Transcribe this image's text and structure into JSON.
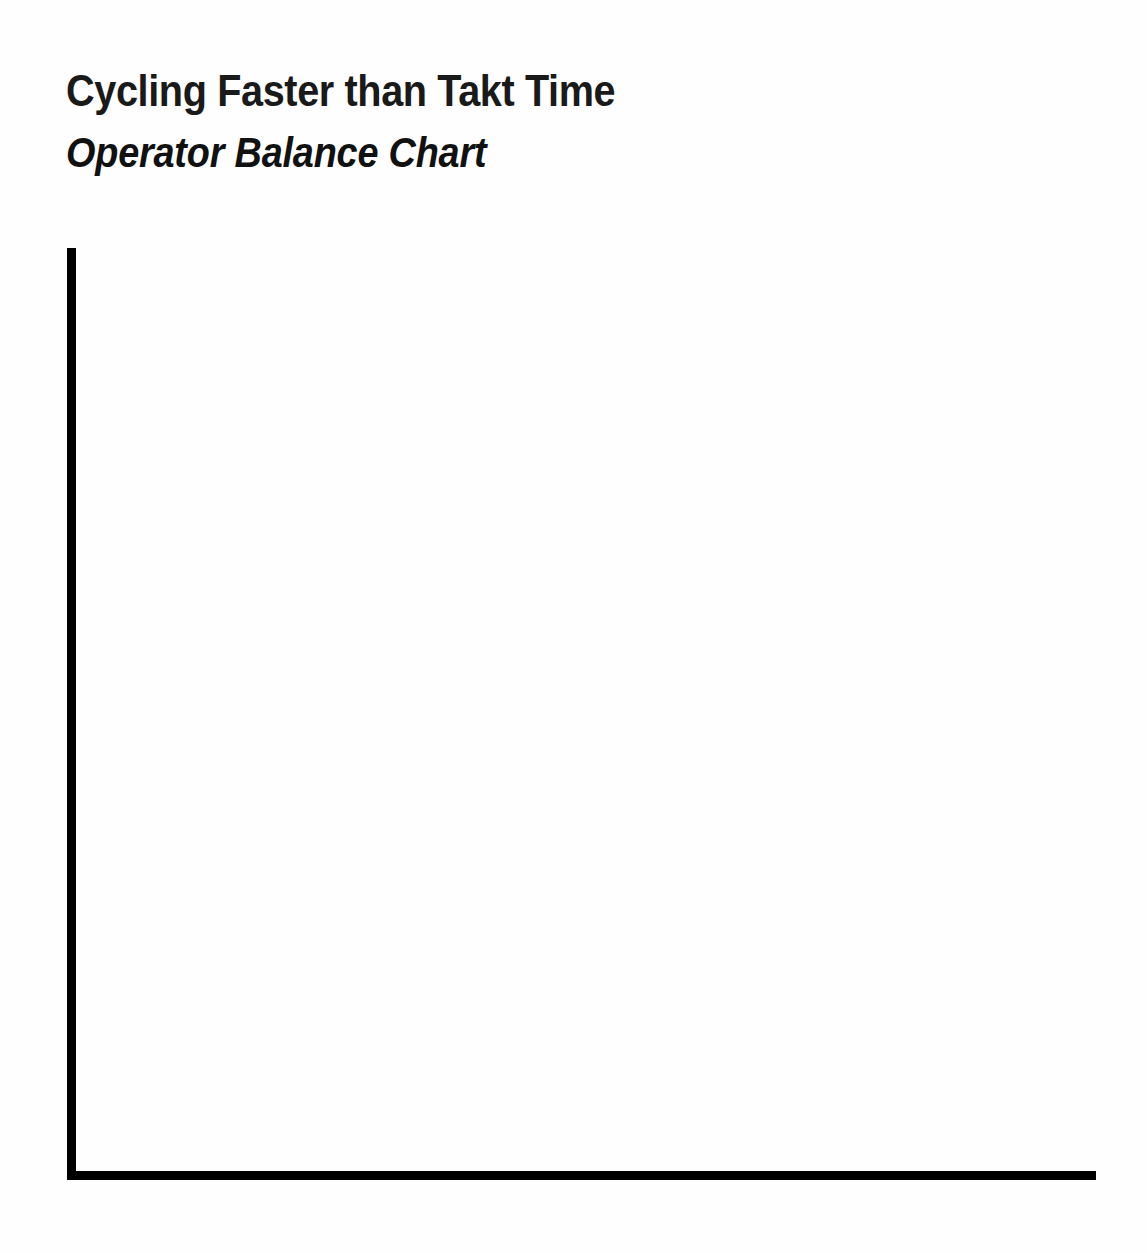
{
  "page": {
    "background_color": "#fefefe",
    "width": 1147,
    "height": 1253
  },
  "header": {
    "title": "Cycling Faster than Takt Time",
    "subtitle": "Operator Balance Chart"
  },
  "chart_data": {
    "type": "bar",
    "title": "Cycling Faster than Takt Time",
    "subtitle": "Operator Balance Chart",
    "categories": [],
    "values": [],
    "series": [],
    "xlabel": "",
    "ylabel": "",
    "xlim": null,
    "ylim": null,
    "grid": false,
    "legend": false,
    "legend_position": "none",
    "annotations": [],
    "axis_color": "#000000",
    "axis_line_width_px": 9,
    "note": "Blank operator balance chart template: only the L-shaped x and y axes are drawn; the plot area contains no bars, lines, tick marks, tick labels, gridlines, or legend."
  }
}
